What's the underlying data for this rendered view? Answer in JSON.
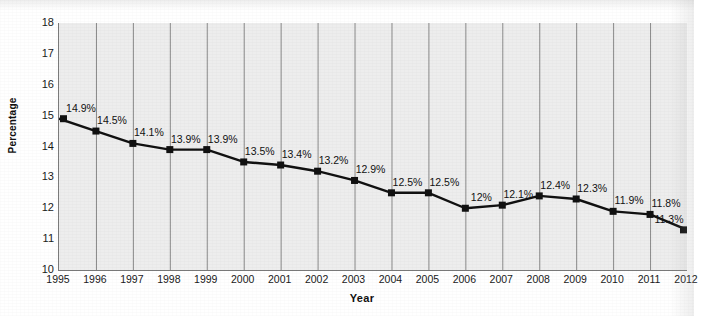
{
  "chart_data": {
    "type": "line",
    "title": "",
    "xlabel": "Year",
    "ylabel": "Percentage",
    "categories": [
      "1995",
      "1996",
      "1997",
      "1998",
      "1999",
      "2000",
      "2001",
      "2002",
      "2003",
      "2004",
      "2005",
      "2006",
      "2007",
      "2008",
      "2009",
      "2010",
      "2011",
      "2012"
    ],
    "values": [
      14.9,
      14.5,
      14.1,
      13.9,
      13.9,
      13.5,
      13.4,
      13.2,
      12.9,
      12.5,
      12.5,
      12.0,
      12.1,
      12.4,
      12.3,
      11.9,
      11.8,
      11.3
    ],
    "point_labels": [
      "14.9%",
      "14.5%",
      "14.1%",
      "13.9%",
      "13.9%",
      "13.5%",
      "13.4%",
      "13.2%",
      "12.9%",
      "12.5%",
      "12.5%",
      "12%",
      "12.1%",
      "12.4%",
      "12.3%",
      "11.9%",
      "11.8%",
      "11.3%"
    ],
    "ylim": [
      10,
      18
    ],
    "ytick_labels": [
      "18",
      "17",
      "16",
      "15",
      "14",
      "13",
      "12",
      "11",
      "10"
    ],
    "ytick_values": [
      18,
      17,
      16,
      15,
      14,
      13,
      12,
      11,
      10
    ],
    "grid": "vertical",
    "legend": "none",
    "series_color": "#111111",
    "marker": "square",
    "plot_background": "#ededed",
    "gridline_color": "#8a8a8a",
    "axis_color": "#7a7a7a"
  }
}
